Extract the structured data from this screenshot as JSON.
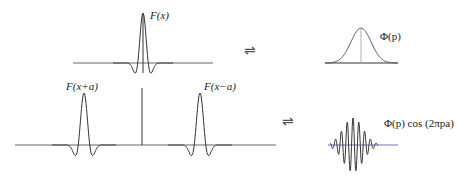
{
  "panels": {
    "top_left": {
      "label": "F(x)"
    },
    "top_right": {
      "label": "Φ(p)"
    },
    "bottom_left": {
      "label_left": "F(x+a)",
      "label_right": "F(x−a)"
    },
    "bottom_right": {
      "label": "Φ(p) cos (2πpa)"
    }
  },
  "arrows": {
    "top": "⇌",
    "bottom": "⇌"
  },
  "colors": {
    "line": "#333333",
    "axis": "#666666",
    "axis_tint_right": "#7a5fb0"
  }
}
